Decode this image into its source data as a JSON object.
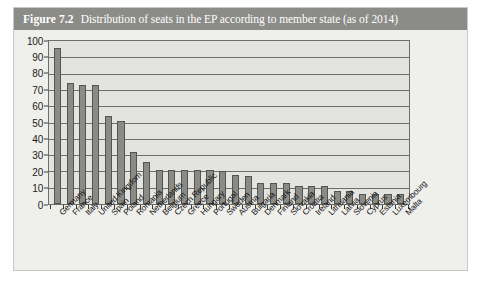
{
  "figure": {
    "number": "Figure 7.2",
    "title": "Distribution of seats in the EP according to member state (as of 2014)"
  },
  "colors": {
    "title_band": "#8b8b87",
    "title_text": "#ffffff",
    "bar_fill": "#8a8a86",
    "bar_border": "#55554f",
    "plot_background": "#e3e3e0",
    "figure_background": "#efefec",
    "gridline": "#6d6d6a"
  },
  "chart_data": {
    "type": "bar",
    "title": "Distribution of seats in the EP according to member state (as of 2014)",
    "xlabel": "",
    "ylabel": "",
    "ylim": [
      0,
      100
    ],
    "yticks": [
      0,
      10,
      20,
      30,
      40,
      50,
      60,
      70,
      80,
      90,
      100
    ],
    "ytick_labels": [
      "0",
      "10",
      "20",
      "30",
      "40",
      "50",
      "60",
      "70",
      "80",
      "90",
      "100"
    ],
    "grid": true,
    "legend": false,
    "orientation": "vertical",
    "categories": [
      "Germany",
      "France",
      "Italy",
      "United Kingdom",
      "Spain",
      "Poland",
      "Romania",
      "Netherlands",
      "Belgium",
      "Czech Republic",
      "Greece",
      "Hungary",
      "Portugal",
      "Sweden",
      "Austria",
      "Bulgaria",
      "Denmark",
      "Finland",
      "Slovakia",
      "Croatia",
      "Ireland",
      "Lithuania",
      "Latvia",
      "Slovenia",
      "Cyprus",
      "Estonia",
      "Luxembourg",
      "Malta"
    ],
    "values": [
      96,
      74,
      73,
      73,
      54,
      51,
      32,
      26,
      21,
      21,
      21,
      21,
      21,
      20,
      18,
      17,
      13,
      13,
      13,
      11,
      11,
      11,
      8,
      8,
      6,
      6,
      6,
      6
    ]
  }
}
